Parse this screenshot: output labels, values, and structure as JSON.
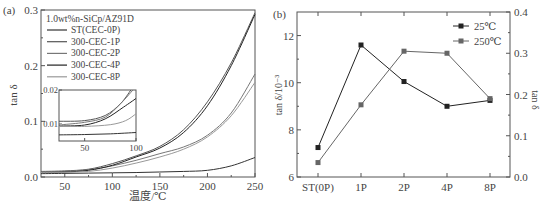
{
  "chart_data": [
    {
      "panel": "(a)",
      "type": "line",
      "title": "",
      "xlabel": "温度/℃",
      "ylabel": "tan δ",
      "xlim": [
        25,
        250
      ],
      "ylim": [
        0.0,
        0.3
      ],
      "xticks": [
        "50",
        "100",
        "150",
        "200",
        "250"
      ],
      "yticks": [
        "0.0",
        "0.1",
        "0.2",
        "0.3"
      ],
      "legend_title": "1.0wt%n-SiCp/AZ91D",
      "legend_position": "upper left",
      "x": [
        25,
        50,
        75,
        100,
        125,
        150,
        175,
        200,
        225,
        250
      ],
      "series": [
        {
          "name": "ST(CEC-0P)",
          "color": "#333333",
          "values": [
            0.006,
            0.0065,
            0.007,
            0.0075,
            0.008,
            0.009,
            0.01,
            0.012,
            0.02,
            0.035
          ]
        },
        {
          "name": "300-CEC-1P",
          "color": "#555555",
          "values": [
            0.01,
            0.011,
            0.014,
            0.024,
            0.038,
            0.055,
            0.085,
            0.135,
            0.205,
            0.295
          ]
        },
        {
          "name": "300-CEC-2P",
          "color": "#777777",
          "values": [
            0.009,
            0.01,
            0.013,
            0.02,
            0.03,
            0.042,
            0.054,
            0.075,
            0.115,
            0.185
          ]
        },
        {
          "name": "300-CEC-4P",
          "color": "#222222",
          "values": [
            0.008,
            0.009,
            0.012,
            0.021,
            0.036,
            0.052,
            0.08,
            0.128,
            0.2,
            0.292
          ]
        },
        {
          "name": "300-CEC-8P",
          "color": "#999999",
          "values": [
            0.008,
            0.0085,
            0.01,
            0.016,
            0.025,
            0.036,
            0.05,
            0.072,
            0.11,
            0.17
          ]
        }
      ],
      "inset": {
        "xlim": [
          25,
          100
        ],
        "ylim": [
          0.005,
          0.02
        ],
        "xticks": [
          "50",
          "100"
        ],
        "yticks": [
          "0.01",
          "0.02"
        ]
      }
    },
    {
      "panel": "(b)",
      "type": "line",
      "title": "",
      "xlabel": "",
      "ylabel": "tan δ/10⁻³",
      "ylabel_right": "tan δ",
      "categories": [
        "ST(0P)",
        "1P",
        "2P",
        "4P",
        "8P"
      ],
      "ylim": [
        6,
        13
      ],
      "ylim_right": [
        0.0,
        0.4
      ],
      "yticks": [
        "6",
        "8",
        "10",
        "12"
      ],
      "yticks_right": [
        "0.0",
        "0.1",
        "0.2",
        "0.3",
        "0.4"
      ],
      "legend_position": "upper right",
      "series": [
        {
          "name": "25℃",
          "axis": "left",
          "color": "#222222",
          "marker": "square",
          "values": [
            7.25,
            11.6,
            10.05,
            9.0,
            9.25
          ]
        },
        {
          "name": "250℃",
          "axis": "right",
          "color": "#666666",
          "marker": "square",
          "values": [
            0.035,
            0.175,
            0.305,
            0.3,
            0.19
          ]
        }
      ]
    }
  ],
  "labels": {
    "panel_a": "(a)",
    "panel_b": "(b)",
    "a_xlabel": "温度/℃",
    "a_ylabel": "tan δ",
    "a_legend_title": "1.0wt%n-SiCp/AZ91D",
    "b_ylabel_left": "tan δ/10⁻³",
    "b_ylabel_right": "tan δ"
  }
}
